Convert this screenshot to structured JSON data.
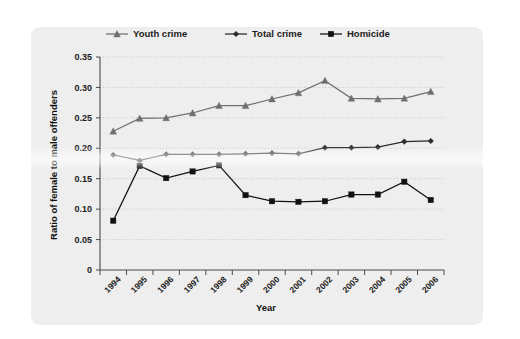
{
  "chart_data": {
    "type": "line",
    "title": "",
    "xlabel": "Year",
    "ylabel": "Ratio of female to male offenders",
    "categories": [
      "1994",
      "1995",
      "1996",
      "1997",
      "1998",
      "1999",
      "2000",
      "2001",
      "2002",
      "2003",
      "2004",
      "2005",
      "2006"
    ],
    "ylim": [
      0,
      0.35
    ],
    "yticks": [
      0,
      0.05,
      0.1,
      0.15,
      0.2,
      0.25,
      0.3,
      0.35
    ],
    "ytick_labels": [
      "0",
      "0.05",
      "0.10",
      "0.15",
      "0.20",
      "0.25",
      "0.30",
      "0.35"
    ],
    "grid": "horizontal-dotted",
    "legend_position": "top-center",
    "series": [
      {
        "name": "Youth crime",
        "marker": "triangle",
        "color": "#6f6f6f",
        "values": [
          0.228,
          0.249,
          0.25,
          0.258,
          0.27,
          0.27,
          0.281,
          0.291,
          0.311,
          0.282,
          0.281,
          0.282,
          0.293
        ]
      },
      {
        "name": "Total crime",
        "marker": "diamond",
        "color": "#2a2a2a",
        "values": [
          0.189,
          0.18,
          0.19,
          0.19,
          0.19,
          0.191,
          0.192,
          0.191,
          0.201,
          0.201,
          0.202,
          0.211,
          0.212
        ]
      },
      {
        "name": "Homicide",
        "marker": "square",
        "color": "#111111",
        "values": [
          0.081,
          0.171,
          0.151,
          0.162,
          0.172,
          0.123,
          0.113,
          0.112,
          0.113,
          0.124,
          0.124,
          0.145,
          0.115
        ]
      }
    ]
  },
  "figure": {
    "panel_background": "#eeeeee",
    "page_background": "#ffffff"
  }
}
